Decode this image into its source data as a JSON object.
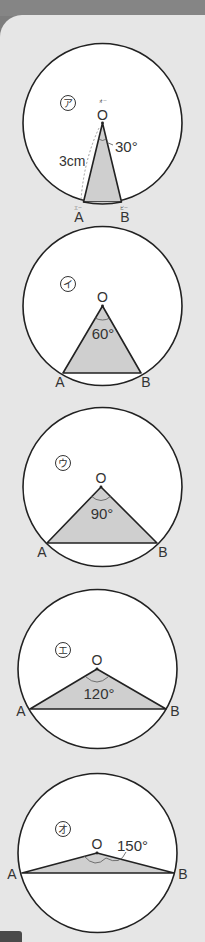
{
  "colors": {
    "background": "#e6e6e6",
    "header": "#858585",
    "circle_fill": "#ffffff",
    "stroke": "#222222",
    "triangle_fill": "#cfcfcf",
    "text": "#333333"
  },
  "figures": [
    {
      "id": "a",
      "marker": "ア",
      "center_label": "O",
      "center_ruby": "オー",
      "angle_label": "30°",
      "radius_label": "3cm",
      "point_a": "A",
      "point_a_ruby": "エー",
      "point_b": "B",
      "point_b_ruby": "ビー",
      "angle_deg": 30
    },
    {
      "id": "i",
      "marker": "イ",
      "center_label": "O",
      "angle_label": "60°",
      "point_a": "A",
      "point_b": "B",
      "angle_deg": 60
    },
    {
      "id": "u",
      "marker": "ウ",
      "center_label": "O",
      "angle_label": "90°",
      "point_a": "A",
      "point_b": "B",
      "angle_deg": 90
    },
    {
      "id": "e",
      "marker": "エ",
      "center_label": "O",
      "angle_label": "120°",
      "point_a": "A",
      "point_b": "B",
      "angle_deg": 120
    },
    {
      "id": "o",
      "marker": "オ",
      "center_label": "O",
      "angle_label": "150°",
      "point_a": "A",
      "point_b": "B",
      "angle_deg": 150
    }
  ]
}
